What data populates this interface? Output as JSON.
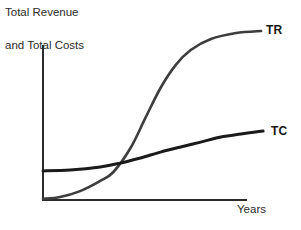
{
  "figure": {
    "title_lines": [
      "Total Revenue",
      "and Total Costs"
    ],
    "x_axis_label": "Years"
  },
  "chart_data": {
    "type": "line",
    "title": "Total Revenue and Total Costs",
    "xlabel": "Years",
    "ylabel": "Total Revenue and Total Costs",
    "axis_ticks": "none",
    "gridlines": false,
    "legend_position": "labels at right end of each curve",
    "axis_color": "#2b2b2b",
    "series": [
      {
        "name": "total-revenue",
        "label": "TR",
        "color": "#3d3d3d",
        "stroke_width": 2.6,
        "points_pct": [
          [
            0,
            0.6
          ],
          [
            8.4,
            1.7
          ],
          [
            18.2,
            5.1
          ],
          [
            28.1,
            10.9
          ],
          [
            34.5,
            16.0
          ],
          [
            42.9,
            29.7
          ],
          [
            50.2,
            46.9
          ],
          [
            57.6,
            64.0
          ],
          [
            65.0,
            77.1
          ],
          [
            72.4,
            85.7
          ],
          [
            82.3,
            92.0
          ],
          [
            94.6,
            95.4
          ],
          [
            106.9,
            96.6
          ]
        ]
      },
      {
        "name": "total-costs",
        "label": "TC",
        "color": "#1a1a1a",
        "stroke_width": 3,
        "points_pct": [
          [
            0,
            16.6
          ],
          [
            13.3,
            17.1
          ],
          [
            28.1,
            18.9
          ],
          [
            37.9,
            21.1
          ],
          [
            47.8,
            24.0
          ],
          [
            57.6,
            27.4
          ],
          [
            67.5,
            30.3
          ],
          [
            77.3,
            33.1
          ],
          [
            87.2,
            36.0
          ],
          [
            97.0,
            37.7
          ],
          [
            107.9,
            39.4
          ]
        ]
      }
    ]
  }
}
